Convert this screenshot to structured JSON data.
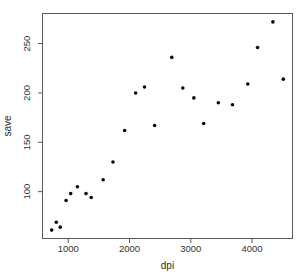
{
  "figure": {
    "background": "#ffffff",
    "axis_color": "#5a5a5a",
    "text_color": "#333333",
    "point_color": "#0a0a0a",
    "point_radius": 1.8
  },
  "chart_data": {
    "type": "scatter",
    "title": "",
    "xlabel": "dpi",
    "ylabel": "save",
    "x": [
      730,
      805,
      870,
      965,
      1040,
      1150,
      1290,
      1375,
      1570,
      1730,
      1920,
      2100,
      2245,
      2410,
      2690,
      2870,
      3050,
      3210,
      3450,
      3680,
      3930,
      4090,
      4340,
      4510
    ],
    "y": [
      61,
      69,
      64,
      91,
      98,
      105,
      98,
      94,
      112,
      130,
      162,
      200,
      206,
      167,
      236,
      205,
      195,
      169,
      190,
      188,
      209,
      246,
      272,
      214
    ],
    "xticks": [
      1000,
      2000,
      3000,
      4000
    ],
    "yticks": [
      100,
      150,
      200,
      250
    ],
    "xlim": [
      580,
      4660
    ],
    "ylim": [
      52.5,
      280.5
    ],
    "grid": false,
    "legend": null,
    "marker": "filled-circle"
  }
}
